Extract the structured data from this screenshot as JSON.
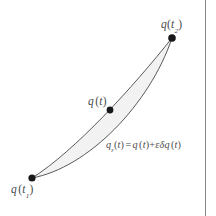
{
  "figure": {
    "background_color": "#ffffff",
    "ink_color": "#3c3c3e",
    "curve_color": "#47474a",
    "shade_color": "#f2f2f2",
    "page_edge_color": "#6f6f72",
    "labels": {
      "endpoint_end": {
        "text": "q(t2)",
        "symbol": "q",
        "arg_open": "(",
        "arg_symbol": "t",
        "arg_subscript": "2",
        "arg_close": ")"
      },
      "endpoint_start": {
        "text": "q(t1)",
        "symbol": "q",
        "arg_open": "(",
        "arg_symbol": "t",
        "arg_subscript": "1",
        "arg_close": ")"
      },
      "true_path": {
        "text": "q(t)",
        "symbol": "q",
        "arg_open": "(",
        "arg_symbol": "t",
        "arg_close": ")"
      },
      "varied_path_equation": {
        "text": "q_e(t) = q(t) + e.dq(t)",
        "lhs_symbol": "q",
        "lhs_subscript": "ε",
        "lhs_arg_open": "(",
        "lhs_arg": "t",
        "lhs_arg_close": ")",
        "equals": "=",
        "rhs_term1_symbol": "q",
        "rhs_term1_open": "(",
        "rhs_term1_arg": "t",
        "rhs_term1_close": ")",
        "plus": "+",
        "rhs_epsilon": "ε",
        "rhs_delta": "δ",
        "rhs_term2_symbol": "q",
        "rhs_term2_open": "(",
        "rhs_term2_arg": "t",
        "rhs_term2_close": ")"
      }
    },
    "points": [
      {
        "name": "start-endpoint",
        "x": 32,
        "y": 178,
        "radius": 3.6
      },
      {
        "name": "end-endpoint",
        "x": 172,
        "y": 38,
        "radius": 3.8
      },
      {
        "name": "true-path-point",
        "x": 110,
        "y": 110,
        "radius": 3.4
      }
    ],
    "curves": {
      "true_path": {
        "name": "true-path-curve",
        "start": {
          "x": 32,
          "y": 178
        },
        "control1": {
          "x": 74,
          "y": 152
        },
        "control2": {
          "x": 134,
          "y": 86
        },
        "end": {
          "x": 172,
          "y": 38
        },
        "stroke_width": 0.9
      },
      "varied_path": {
        "name": "varied-path-curve",
        "start": {
          "x": 32,
          "y": 178
        },
        "control1": {
          "x": 88,
          "y": 168
        },
        "control2": {
          "x": 150,
          "y": 104
        },
        "end": {
          "x": 172,
          "y": 38
        },
        "stroke_width": 0.9
      }
    }
  }
}
